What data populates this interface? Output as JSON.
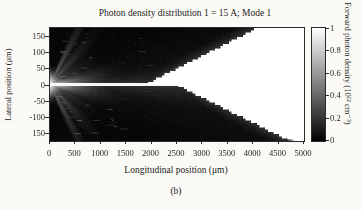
{
  "figure": {
    "title": "Photon density distribution 1 = 15 A; Mode 1",
    "caption": "(b)"
  },
  "y_axis": {
    "label": "Lateral position (μm)",
    "ticks": [
      "150",
      "100",
      "50",
      "0",
      "-50",
      "-100",
      "150"
    ]
  },
  "x_axis": {
    "label": "Longitudinal position (μm)",
    "ticks": [
      "0",
      "500",
      "1000",
      "1500",
      "2000",
      "2500",
      "3000",
      "3500",
      "4000",
      "4500",
      "5000"
    ]
  },
  "colorbar": {
    "label": "Forward photon density (10¹² cm⁻³)",
    "ticks": [
      "1",
      "0.8",
      "0.6",
      "0.4",
      "0.2",
      "0"
    ],
    "top_color": "#ffffff",
    "bottom_color": "#000000"
  },
  "chart_data": {
    "type": "heatmap",
    "title": "Photon density distribution 1 = 15 A; Mode 1",
    "xlabel": "Longitudinal position (μm)",
    "ylabel": "Lateral position (μm)",
    "value_label": "Forward photon density (10¹² cm⁻³)",
    "xlim": [
      0,
      5000
    ],
    "ylim": [
      -175,
      175
    ],
    "value_range": [
      0,
      1
    ],
    "colormap": "grayscale, black=0 to white=1",
    "x_ticks": [
      0,
      500,
      1000,
      1500,
      2000,
      2500,
      3000,
      3500,
      4000,
      4500,
      5000
    ],
    "y_ticks": [
      150,
      100,
      50,
      0,
      -50,
      -100,
      -150
    ],
    "colorbar_ticks": [
      1,
      0.8,
      0.6,
      0.4,
      0.2,
      0
    ],
    "render": {
      "background_value": 0.03,
      "wedge": {
        "tip_top_um": 1900,
        "full_top_um": 4100,
        "tip_bottom_um": 2500,
        "full_bottom_um": 4730,
        "step_x_um": 55,
        "step_y_um": 7,
        "bottom_tail_start_um": 4640,
        "bottom_tail_end_um": 4800
      },
      "center_line": {
        "half_width_um": 4.5,
        "end_um": 2750,
        "value": 0.97
      },
      "facet_burst": {
        "blob_decay_x_um": 240,
        "blob_sigma_um": 25,
        "finger_slopes": [
          -0.3,
          -0.17,
          -0.08,
          0,
          0.08,
          0.17,
          0.3
        ],
        "finger_decay_x_um": 380
      },
      "halo": {
        "amp": 0.2,
        "base_um": 5,
        "growth": 0.022
      },
      "penumbra": {
        "amp": 0.22,
        "scale_um": 26,
        "min_x_um": 1500
      },
      "speckle_rays": {
        "count": 160,
        "max_x_um": 2600
      }
    }
  }
}
